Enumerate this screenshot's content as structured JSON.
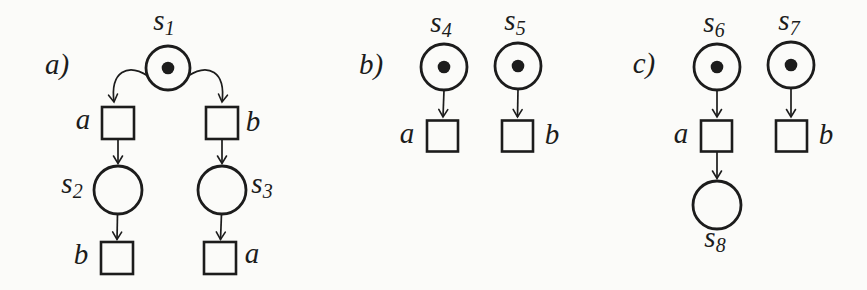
{
  "figure": {
    "type": "petri-net-diagram",
    "ink_color": "#1c1c1c",
    "background_color": "#fbfbf9",
    "token_radius": 6.3,
    "panels": [
      {
        "id": "a",
        "label": "a)",
        "label_x": 57,
        "label_y": 74,
        "places": [
          {
            "id": "s1",
            "label_base": "s",
            "label_sub": "1",
            "x": 168,
            "y": 68,
            "r": 22,
            "token": true,
            "label_x": 164,
            "label_y": 30
          },
          {
            "id": "s2",
            "label_base": "s",
            "label_sub": "2",
            "x": 118,
            "y": 190,
            "r": 24,
            "token": false,
            "label_x": 72,
            "label_y": 193
          },
          {
            "id": "s3",
            "label_base": "s",
            "label_sub": "3",
            "x": 222,
            "y": 190,
            "r": 24,
            "token": false,
            "label_x": 262,
            "label_y": 193
          }
        ],
        "transitions": [
          {
            "id": "a-upper",
            "label": "a",
            "x": 118,
            "y": 123,
            "size": 32,
            "label_x": 83,
            "label_y": 129
          },
          {
            "id": "b-upper",
            "label": "b",
            "x": 222,
            "y": 123,
            "size": 32,
            "label_x": 253,
            "label_y": 131
          },
          {
            "id": "b-lower",
            "label": "b",
            "x": 117,
            "y": 258,
            "size": 32,
            "label_x": 81,
            "label_y": 264
          },
          {
            "id": "a-lower",
            "label": "a",
            "x": 220,
            "y": 258,
            "size": 32,
            "label_x": 252,
            "label_y": 263
          }
        ],
        "arcs": [
          {
            "from": "s1",
            "to": "a-upper",
            "path": "M 148 76 C 128 63 110 71 114 102"
          },
          {
            "from": "s1",
            "to": "b-upper",
            "path": "M 188 76 C 208 63 226 71 222 102"
          },
          {
            "from": "a-upper",
            "to": "s2",
            "path": "M 118 139.5 L 118 163.5"
          },
          {
            "from": "b-upper",
            "to": "s3",
            "path": "M 222 139.5 L 222 163.5"
          },
          {
            "from": "s2",
            "to": "b-lower",
            "path": "M 117.5 214 L 117 239.5"
          },
          {
            "from": "s3",
            "to": "a-lower",
            "path": "M 221.5 214 L 220.5 239.5"
          }
        ]
      },
      {
        "id": "b",
        "label": "b)",
        "label_x": 371,
        "label_y": 74,
        "places": [
          {
            "id": "s4",
            "label_base": "s",
            "label_sub": "4",
            "x": 444,
            "y": 67,
            "r": 23,
            "token": true,
            "label_x": 441,
            "label_y": 32
          },
          {
            "id": "s5",
            "label_base": "s",
            "label_sub": "5",
            "x": 518,
            "y": 66,
            "r": 23,
            "token": true,
            "label_x": 515,
            "label_y": 30
          }
        ],
        "transitions": [
          {
            "id": "a",
            "label": "a",
            "x": 442.5,
            "y": 136,
            "size": 31,
            "label_x": 407,
            "label_y": 143
          },
          {
            "id": "b",
            "label": "b",
            "x": 517.5,
            "y": 136,
            "size": 31,
            "label_x": 552,
            "label_y": 144
          }
        ],
        "arcs": [
          {
            "from": "s4",
            "to": "a",
            "path": "M 444 90 L 443 117"
          },
          {
            "from": "s5",
            "to": "b",
            "path": "M 518 89 L 517.5 117"
          }
        ]
      },
      {
        "id": "c",
        "label": "c)",
        "label_x": 644,
        "label_y": 73,
        "places": [
          {
            "id": "s6",
            "label_base": "s",
            "label_sub": "6",
            "x": 717,
            "y": 67,
            "r": 23,
            "token": true,
            "label_x": 714,
            "label_y": 32
          },
          {
            "id": "s7",
            "label_base": "s",
            "label_sub": "7",
            "x": 791,
            "y": 65,
            "r": 23,
            "token": true,
            "label_x": 789,
            "label_y": 30
          },
          {
            "id": "s8",
            "label_base": "s",
            "label_sub": "8",
            "x": 717,
            "y": 205,
            "r": 24,
            "token": false,
            "label_x": 715,
            "label_y": 247
          }
        ],
        "transitions": [
          {
            "id": "a",
            "label": "a",
            "x": 716.5,
            "y": 136,
            "size": 31,
            "label_x": 681,
            "label_y": 143
          },
          {
            "id": "b",
            "label": "b",
            "x": 791.5,
            "y": 136,
            "size": 31,
            "label_x": 826,
            "label_y": 144
          }
        ],
        "arcs": [
          {
            "from": "s6",
            "to": "a",
            "path": "M 717 90.5 L 717 117"
          },
          {
            "from": "s7",
            "to": "b",
            "path": "M 791 88.5 L 791 117"
          },
          {
            "from": "a",
            "to": "s8",
            "path": "M 717 151.5 L 717 178.5"
          }
        ]
      }
    ]
  }
}
